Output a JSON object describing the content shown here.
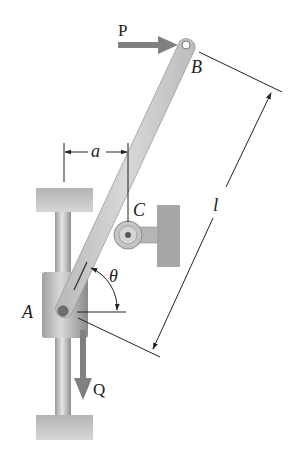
{
  "diagram": {
    "title": "",
    "labels": {
      "P": "P",
      "B": "B",
      "a": "a",
      "C": "C",
      "l": "l",
      "theta": "θ",
      "A": "A",
      "Q": "Q"
    },
    "components": [
      {
        "id": "bar-AB",
        "type": "rigid bar",
        "from": "A",
        "to": "B"
      },
      {
        "id": "collar-A",
        "type": "sliding collar on vertical rod"
      },
      {
        "id": "roller-C",
        "type": "roller support on wall bracket"
      },
      {
        "id": "force-P",
        "type": "horizontal force at B",
        "direction": "right"
      },
      {
        "id": "force-Q",
        "type": "vertical force at A",
        "direction": "down"
      },
      {
        "id": "dim-a",
        "type": "horizontal dimension between rod axis and C"
      },
      {
        "id": "dim-l",
        "type": "length dimension of bar AB"
      },
      {
        "id": "angle-theta",
        "type": "angle between bar and horizontal"
      }
    ],
    "colors": {
      "bar": "#c8c8c8",
      "support": "#a9a9a9",
      "arrow": "#7a7a7a",
      "line": "#222222"
    }
  }
}
